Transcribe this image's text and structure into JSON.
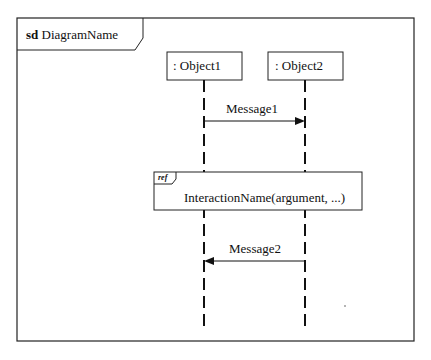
{
  "frame": {
    "keyword": "sd",
    "name": "DiagramName"
  },
  "lifelines": [
    {
      "label": ": Object1"
    },
    {
      "label": ": Object2"
    }
  ],
  "messages": [
    {
      "label": "Message1",
      "from": ": Object1",
      "to": ": Object2"
    },
    {
      "label": "Message2",
      "from": ": Object2",
      "to": ": Object1"
    }
  ],
  "ref": {
    "keyword": "ref",
    "text": "InteractionName(argument, ...)"
  }
}
